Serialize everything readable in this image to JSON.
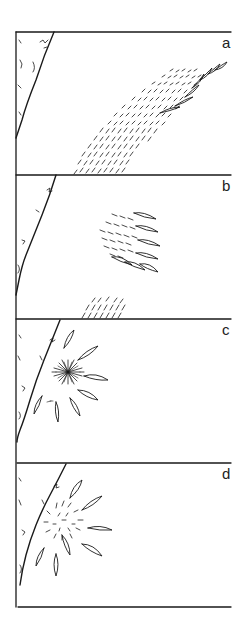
{
  "figure": {
    "panels": [
      {
        "label": "a",
        "description": "broad band of aligned streaks rising from bottom-center to upper-right, ending in elongated lens shapes"
      },
      {
        "label": "b",
        "description": "compact cluster of short streaks with row of lens shapes on right, small streak patch at bottom"
      },
      {
        "label": "c",
        "description": "dense starburst center surrounded by radially arranged lens shapes"
      },
      {
        "label": "d",
        "description": "loose radial streaks surrounded by radially arranged lens shapes"
      }
    ],
    "caption_partial": "",
    "colors": {
      "ink": "#1a1a1a",
      "background": "#ffffff"
    }
  }
}
